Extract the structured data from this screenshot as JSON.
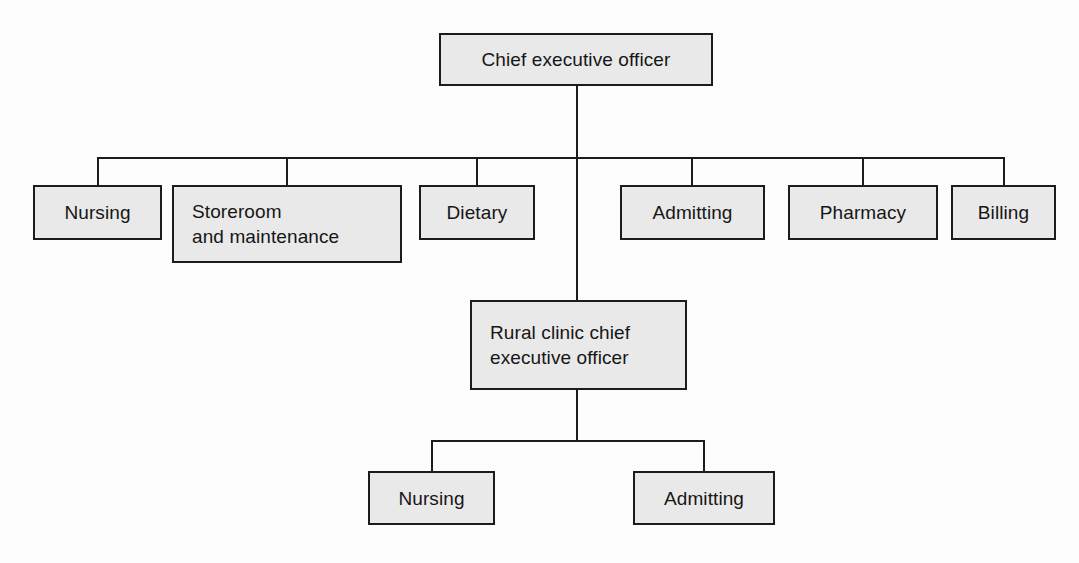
{
  "diagram": {
    "type": "org-chart",
    "colors": {
      "box_fill": "#e9e9e9",
      "box_border": "#1c1c1c",
      "line": "#1c1c1c",
      "text": "#161616",
      "background": "#fdfdfd"
    },
    "nodes": {
      "ceo": {
        "label": "Chief executive officer",
        "align": "center"
      },
      "nursing": {
        "label": "Nursing",
        "align": "center"
      },
      "storeroom": {
        "label": "Storeroom\nand maintenance",
        "align": "left"
      },
      "dietary": {
        "label": "Dietary",
        "align": "center"
      },
      "admitting": {
        "label": "Admitting",
        "align": "center"
      },
      "pharmacy": {
        "label": "Pharmacy",
        "align": "center"
      },
      "billing": {
        "label": "Billing",
        "align": "center"
      },
      "rural_ceo": {
        "label": "Rural clinic chief\nexecutive officer",
        "align": "left"
      },
      "rural_nursing": {
        "label": "Nursing",
        "align": "center"
      },
      "rural_admitting": {
        "label": "Admitting",
        "align": "center"
      }
    },
    "levels": {
      "level_1": [
        "Chief executive officer"
      ],
      "level_2": [
        "Nursing",
        "Storeroom and maintenance",
        "Dietary",
        "Admitting",
        "Pharmacy",
        "Billing"
      ],
      "level_3": [
        "Rural clinic chief executive officer"
      ],
      "level_4": [
        "Nursing",
        "Admitting"
      ]
    }
  }
}
